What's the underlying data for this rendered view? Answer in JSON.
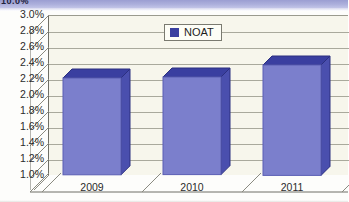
{
  "banner": {
    "text": "10.0%",
    "color": "#adb0dc"
  },
  "legend": {
    "label": "NOAT",
    "swatch_color": "#3a3fa0",
    "position": "top-center"
  },
  "chart_data": {
    "type": "bar",
    "title": "",
    "subtitle": "",
    "xlabel": "",
    "ylabel": "",
    "categories": [
      "2009",
      "2010",
      "2011"
    ],
    "series": [
      {
        "name": "NOAT",
        "values": [
          2.21,
          2.22,
          2.38
        ]
      }
    ],
    "ylim": [
      1.0,
      3.0
    ],
    "ytick_values": [
      3.0,
      2.8,
      2.6,
      2.4,
      2.2,
      2.0,
      1.8,
      1.6,
      1.4,
      1.2,
      1.0
    ],
    "ytick_labels": [
      "3.0%",
      "2.8%",
      "2.6%",
      "2.4%",
      "2.2%",
      "2.0%",
      "1.8%",
      "1.6%",
      "1.4%",
      "1.2%",
      "1.0%"
    ],
    "grid": true,
    "legend_position": "top-center",
    "style": "3d-column",
    "colors": {
      "bar_front": "#7b7fcc",
      "bar_top": "#3a3fa0",
      "bar_side": "#4a4fae",
      "plot_background": "#f7f6ec",
      "gridline": "#a9a99c",
      "axis": "#6f6f66",
      "text": "#2b2b2b"
    }
  }
}
